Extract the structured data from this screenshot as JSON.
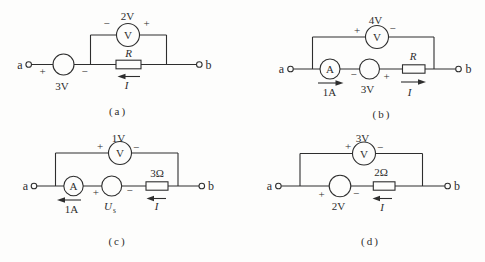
{
  "colors": {
    "background": "#fdfdfc",
    "ink": "#2e2e2e"
  },
  "circuits": {
    "a": {
      "caption": "(a)",
      "terminal_a": "a",
      "terminal_b": "b",
      "source": {
        "plus": "+",
        "minus": "−",
        "label": "3V"
      },
      "voltmeter": {
        "symbol": "V",
        "reading": "2V",
        "plus": "+",
        "minus": "−"
      },
      "resistor": {
        "label": "R"
      },
      "current": {
        "label": "I",
        "direction": "left"
      }
    },
    "b": {
      "caption": "(b)",
      "terminal_a": "a",
      "terminal_b": "b",
      "ammeter": {
        "symbol": "A",
        "reading": "1A",
        "direction": "right"
      },
      "source": {
        "plus": "+",
        "minus": "−",
        "label": "3V"
      },
      "voltmeter": {
        "symbol": "V",
        "reading": "4V",
        "plus": "+",
        "minus": "−"
      },
      "resistor": {
        "label": "R"
      },
      "current": {
        "label": "I",
        "direction": "right"
      }
    },
    "c": {
      "caption": "(c)",
      "terminal_a": "a",
      "terminal_b": "b",
      "ammeter": {
        "symbol": "A",
        "reading": "1A",
        "direction": "left"
      },
      "source": {
        "plus": "+",
        "minus": "−",
        "label_main": "U",
        "label_sub": "s"
      },
      "voltmeter": {
        "symbol": "V",
        "reading": "1V",
        "plus": "+",
        "minus": "−"
      },
      "resistor": {
        "label": "3Ω"
      },
      "current": {
        "label": "I",
        "direction": "left"
      }
    },
    "d": {
      "caption": "(d)",
      "terminal_a": "a",
      "terminal_b": "b",
      "source": {
        "plus": "+",
        "minus": "−",
        "label": "2V"
      },
      "voltmeter": {
        "symbol": "V",
        "reading": "3V",
        "plus": "+",
        "minus": "−"
      },
      "resistor": {
        "label": "2Ω"
      },
      "current": {
        "label": "I",
        "direction": "left"
      }
    }
  }
}
